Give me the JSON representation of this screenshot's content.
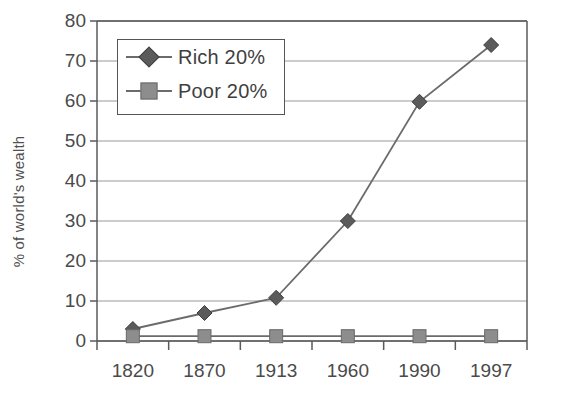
{
  "chart_data": {
    "type": "line",
    "title": "",
    "subtitle": "",
    "xlabel": "",
    "ylabel": "% of world's wealth",
    "categories": [
      "1820",
      "1870",
      "1913",
      "1960",
      "1990",
      "1997"
    ],
    "series": [
      {
        "name": "Rich 20%",
        "marker": "diamond",
        "color": "#5b5b5b",
        "values": [
          3,
          7,
          10.8,
          30,
          59.8,
          74
        ]
      },
      {
        "name": "Poor 20%",
        "marker": "square",
        "color": "#8d8d8d",
        "values": [
          1.2,
          1.2,
          1.2,
          1.2,
          1.2,
          1.2
        ]
      }
    ],
    "ylim": [
      0,
      80
    ],
    "yticks": [
      0,
      10,
      20,
      30,
      40,
      50,
      60,
      70,
      80
    ],
    "ytick_labels": [
      "0",
      "10",
      "20",
      "30",
      "40",
      "50",
      "60",
      "70",
      "80"
    ],
    "grid": true,
    "grid_axis": "y",
    "legend_position": "upper-left-inside",
    "legend_entries": [
      "Rich 20%",
      "Poor 20%"
    ],
    "annotations": []
  },
  "style": {
    "line_color": "#6b6b6b",
    "grid_color": "#9a9a9a",
    "axis_color": "#5a5a5a",
    "text_color": "#4a4a4a",
    "background": "#ffffff"
  },
  "legend": {
    "rows": [
      {
        "label": "Rich 20%",
        "marker": "diamond-marker"
      },
      {
        "label": "Poor 20%",
        "marker": "square-marker"
      }
    ]
  }
}
